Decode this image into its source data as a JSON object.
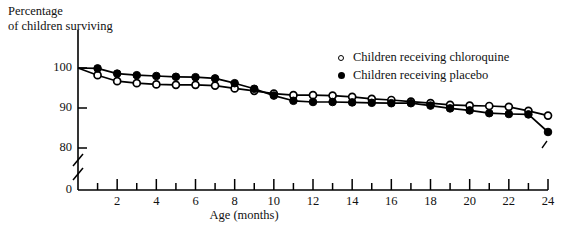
{
  "chart_data": {
    "type": "line",
    "title": "",
    "ylabel_line1": "Percentage",
    "ylabel_line2": "of children surviving",
    "xlabel": "Age (months)",
    "ylim": [
      78,
      102
    ],
    "xlim": [
      0,
      24
    ],
    "yticks": [
      100,
      90,
      80,
      0
    ],
    "ytick_labels": [
      "100",
      "90",
      "80",
      "0"
    ],
    "xticks": [
      0,
      1,
      2,
      3,
      4,
      5,
      6,
      7,
      8,
      9,
      10,
      11,
      12,
      13,
      14,
      15,
      16,
      17,
      18,
      19,
      20,
      21,
      22,
      23,
      24
    ],
    "xtick_labels": [
      "2",
      "4",
      "6",
      "8",
      "10",
      "12",
      "14",
      "16",
      "18",
      "20",
      "22",
      "24"
    ],
    "xtick_label_values": [
      2,
      4,
      6,
      8,
      10,
      12,
      14,
      16,
      18,
      20,
      22,
      24
    ],
    "grid": false,
    "axis_break_y": true,
    "legend_position": "upper right",
    "x": [
      0,
      1,
      2,
      3,
      4,
      5,
      6,
      7,
      8,
      9,
      10,
      11,
      12,
      13,
      14,
      15,
      16,
      17,
      18,
      19,
      20,
      21,
      22,
      23,
      24
    ],
    "series": [
      {
        "name": "Children receiving chloroquine",
        "marker": "open-circle",
        "color": "#000000",
        "values": [
          100.0,
          98.2,
          96.7,
          96.2,
          95.9,
          95.8,
          95.8,
          95.6,
          94.9,
          94.3,
          93.6,
          93.2,
          93.2,
          93.1,
          92.8,
          92.3,
          92.0,
          91.6,
          91.2,
          90.8,
          90.6,
          90.5,
          90.3,
          89.3,
          88.1
        ]
      },
      {
        "name": "Children receiving placebo",
        "marker": "filled-circle",
        "color": "#000000",
        "values": [
          100.0,
          99.9,
          98.6,
          98.2,
          98.0,
          97.8,
          97.7,
          97.4,
          96.2,
          94.8,
          93.1,
          91.8,
          91.5,
          91.5,
          91.4,
          91.3,
          91.2,
          91.2,
          90.6,
          89.9,
          89.4,
          88.7,
          88.5,
          88.4,
          84.0
        ]
      }
    ]
  },
  "legend": {
    "items": [
      {
        "marker": "open-circle",
        "label": "Children receiving chloroquine"
      },
      {
        "marker": "filled-circle",
        "label": "Children receiving placebo"
      }
    ]
  }
}
